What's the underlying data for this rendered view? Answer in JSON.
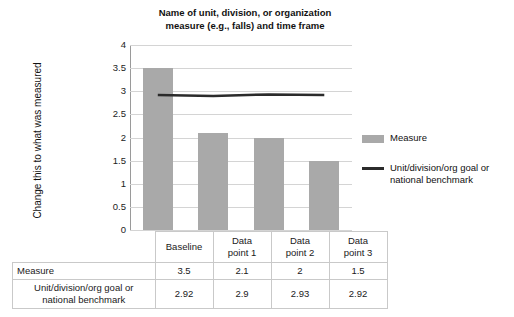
{
  "chart_data": {
    "type": "bar",
    "title": "Name of unit, division, or organization measure (e.g., falls) and time frame",
    "title_line1": "Name of unit, division, or organization",
    "title_line2": "measure (e.g., falls) and time frame",
    "xlabel": "",
    "ylabel": "Change this to what was measured",
    "ylim": [
      0,
      4
    ],
    "ytick_step": 0.5,
    "yticks": [
      "4",
      "3.5",
      "3",
      "2.5",
      "2",
      "1.5",
      "1",
      "0.5",
      "0"
    ],
    "grid": true,
    "legend_position": "right",
    "categories": [
      "Baseline",
      "Data point 1",
      "Data point 2",
      "Data point 3"
    ],
    "series": [
      {
        "name": "Measure",
        "type": "bar",
        "color": "#a9a9a9",
        "values": [
          3.5,
          2.1,
          2,
          1.5
        ],
        "value_labels": [
          "3.5",
          "2.1",
          "2",
          "1.5"
        ]
      },
      {
        "name": "Unit/division/org goal or national benchmark",
        "type": "line",
        "color": "#2b2b2b",
        "values": [
          2.92,
          2.9,
          2.93,
          2.92
        ],
        "value_labels": [
          "2.92",
          "2.9",
          "2.93",
          "2.92"
        ]
      }
    ]
  },
  "legend": {
    "items": [
      {
        "label": "Measure",
        "swatch": "bar",
        "color": "#a9a9a9"
      },
      {
        "label_line1": "Unit/division/org goal or",
        "label_line2": "national benchmark",
        "swatch": "line",
        "color": "#2b2b2b"
      }
    ]
  },
  "table": {
    "column_headers": [
      "Baseline",
      "Data point 1",
      "Data point 2",
      "Data point 3"
    ],
    "column_headers_split": [
      {
        "line1": "Baseline",
        "line2": ""
      },
      {
        "line1": "Data",
        "line2": "point 1"
      },
      {
        "line1": "Data",
        "line2": "point 2"
      },
      {
        "line1": "Data",
        "line2": "point 3"
      }
    ],
    "rows": [
      {
        "label": "Measure",
        "label_line1": "Measure",
        "label_line2": "",
        "values": [
          "3.5",
          "2.1",
          "2",
          "1.5"
        ]
      },
      {
        "label": "Unit/division/org goal or national benchmark",
        "label_line1": "Unit/division/org goal or",
        "label_line2": "national benchmark",
        "values": [
          "2.92",
          "2.9",
          "2.93",
          "2.92"
        ]
      }
    ]
  }
}
